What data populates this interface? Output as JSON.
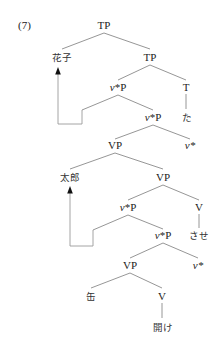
{
  "example_number": "(7)",
  "tree": {
    "nodes": [
      {
        "id": "n0",
        "label": "TP",
        "x": 104,
        "y": 29
      },
      {
        "id": "n1",
        "label": "花子",
        "x": 62,
        "y": 61,
        "script": "jp"
      },
      {
        "id": "n2",
        "label": "TP",
        "x": 150,
        "y": 61
      },
      {
        "id": "n3",
        "label_v": "v",
        "label_rest": "*P",
        "x": 118,
        "y": 91
      },
      {
        "id": "n4",
        "label": "T",
        "x": 186,
        "y": 91
      },
      {
        "id": "n5",
        "label_v": "v",
        "label_rest": "*P",
        "x": 153,
        "y": 121
      },
      {
        "id": "n6",
        "label": "た",
        "x": 187,
        "y": 121,
        "script": "jp"
      },
      {
        "id": "n7",
        "label": "VP",
        "x": 115,
        "y": 149
      },
      {
        "id": "n8",
        "label_v": "v",
        "label_rest": "*",
        "x": 190,
        "y": 149
      },
      {
        "id": "n9",
        "label": "太郎",
        "x": 70,
        "y": 181,
        "script": "jp"
      },
      {
        "id": "n10",
        "label": "VP",
        "x": 163,
        "y": 181
      },
      {
        "id": "n11",
        "label_v": "v",
        "label_rest": "*P",
        "x": 128,
        "y": 211
      },
      {
        "id": "n12",
        "label": "V",
        "x": 199,
        "y": 211
      },
      {
        "id": "n13",
        "label_v": "v",
        "label_rest": "*P",
        "x": 163,
        "y": 239
      },
      {
        "id": "n14",
        "label": "させ",
        "x": 199,
        "y": 239,
        "script": "jp"
      },
      {
        "id": "n15",
        "label": "VP",
        "x": 130,
        "y": 269
      },
      {
        "id": "n16",
        "label_v": "v",
        "label_rest": "*",
        "x": 198,
        "y": 269
      },
      {
        "id": "n17",
        "label": "缶",
        "x": 91,
        "y": 300,
        "script": "jp"
      },
      {
        "id": "n18",
        "label": "V",
        "x": 162,
        "y": 300
      },
      {
        "id": "n19",
        "label": "開け",
        "x": 163,
        "y": 331,
        "script": "jp"
      }
    ],
    "edges": [
      [
        "n0",
        "n1"
      ],
      [
        "n0",
        "n2"
      ],
      [
        "n2",
        "n3"
      ],
      [
        "n2",
        "n4"
      ],
      [
        "n4",
        "n6"
      ],
      [
        "n3",
        "n5"
      ],
      [
        "n5",
        "n7"
      ],
      [
        "n5",
        "n8"
      ],
      [
        "n7",
        "n9"
      ],
      [
        "n7",
        "n10"
      ],
      [
        "n10",
        "n11"
      ],
      [
        "n10",
        "n12"
      ],
      [
        "n12",
        "n14"
      ],
      [
        "n11",
        "n13"
      ],
      [
        "n13",
        "n15"
      ],
      [
        "n13",
        "n16"
      ],
      [
        "n15",
        "n17"
      ],
      [
        "n15",
        "n18"
      ],
      [
        "n18",
        "n19"
      ]
    ],
    "movements": [
      {
        "from_label": "花子",
        "to_node": "n1",
        "trace_from": "n3"
      },
      {
        "from_label": "太郎",
        "to_node": "n9",
        "trace_from": "n11"
      }
    ]
  }
}
